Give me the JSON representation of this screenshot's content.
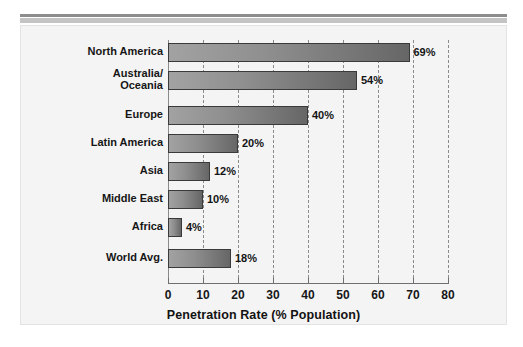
{
  "chart_data": {
    "type": "bar",
    "orientation": "horizontal",
    "title": "",
    "xlabel": "Penetration Rate (% Population)",
    "ylabel": "",
    "xlim": [
      0,
      80
    ],
    "xticks": [
      0,
      10,
      20,
      30,
      40,
      50,
      60,
      70,
      80
    ],
    "xtick_labels": [
      "0",
      "10",
      "20",
      "30",
      "40",
      "50",
      "60",
      "70",
      "80"
    ],
    "grid": "vertical-dashed",
    "legend": "none",
    "categories": [
      "North America",
      "Australia/\nOceania",
      "Europe",
      "Latin America",
      "Asia",
      "Middle East",
      "Africa",
      "World Avg."
    ],
    "values": [
      69,
      54,
      40,
      20,
      12,
      10,
      4,
      18
    ],
    "data_labels": [
      "69%",
      "54%",
      "40%",
      "20%",
      "12%",
      "10%",
      "4%",
      "18%"
    ],
    "bars": [
      {
        "category": "North America",
        "category_line1": "North America",
        "category_line2": "",
        "value": 69,
        "label": "69%"
      },
      {
        "category": "Australia/Oceania",
        "category_line1": "Australia/",
        "category_line2": "Oceania",
        "value": 54,
        "label": "54%"
      },
      {
        "category": "Europe",
        "category_line1": "Europe",
        "category_line2": "",
        "value": 40,
        "label": "40%"
      },
      {
        "category": "Latin America",
        "category_line1": "Latin America",
        "category_line2": "",
        "value": 20,
        "label": "20%"
      },
      {
        "category": "Asia",
        "category_line1": "Asia",
        "category_line2": "",
        "value": 12,
        "label": "12%"
      },
      {
        "category": "Middle East",
        "category_line1": "Middle East",
        "category_line2": "",
        "value": 10,
        "label": "10%"
      },
      {
        "category": "Africa",
        "category_line1": "Africa",
        "category_line2": "",
        "value": 4,
        "label": "4%"
      },
      {
        "category": "World Avg.",
        "category_line1": "World Avg.",
        "category_line2": "",
        "value": 18,
        "label": "18%"
      }
    ],
    "colors": {
      "bar_gradient_start": "#a2a2a2",
      "bar_gradient_end": "#666666",
      "bar_border": "#3a3a3a",
      "panel_background": "#f4f4f4",
      "gridline": "#8a8a8a",
      "axis": "#6f6f6f",
      "text": "#161616",
      "rule_dark": "#8d8d8d",
      "rule_light": "#c4c4c4"
    }
  }
}
